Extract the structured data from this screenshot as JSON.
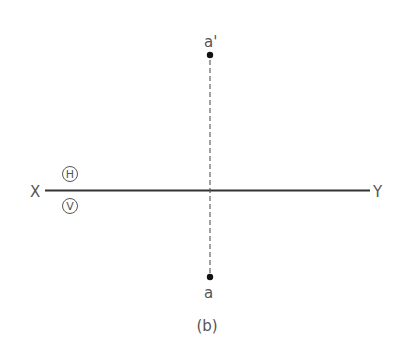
{
  "diagram": {
    "caption": "(b)",
    "ground_line": {
      "left_label": "X",
      "right_label": "Y",
      "upper_plane_label": "H",
      "lower_plane_label": "V"
    },
    "points": [
      {
        "name": "front-view-point",
        "label": "a'"
      },
      {
        "name": "top-view-point",
        "label": "a"
      }
    ],
    "projector": {
      "style": "dashed"
    },
    "colors": {
      "line": "#333333",
      "text": "#555555",
      "point": "#111111"
    }
  }
}
